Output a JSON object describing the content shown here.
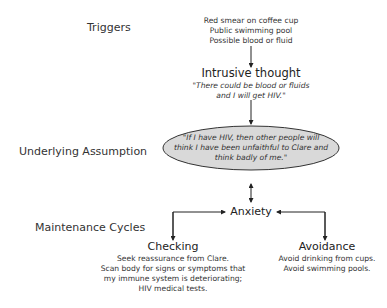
{
  "rows": {
    "triggers_label": "Triggers",
    "assumption_label": "Underlying Assumption",
    "maintenance_label": "Maintenance Cycles"
  },
  "triggers": {
    "items": [
      "Red smear on coffee cup",
      "Public swimming pool",
      "Possible blood or fluid"
    ]
  },
  "intrusive_thought": {
    "title": "Intrusive thought",
    "quote_lines": [
      "\"There could be blood or fluids",
      "and I will get HIV.\""
    ]
  },
  "assumption": {
    "lines": [
      "\"If I have HIV, then other people will",
      "think I have been unfaithful to Clare and",
      "think badly of me.\""
    ],
    "fill_color": "#d9d9d9"
  },
  "anxiety": {
    "label": "Anxiety"
  },
  "checking": {
    "title": "Checking",
    "lines": [
      "Seek reassurance from Clare.",
      "Scan body for signs or symptoms that",
      "my immune system is deteriorating;",
      "HIV medical tests."
    ]
  },
  "avoidance": {
    "title": "Avoidance",
    "lines": [
      "Avoid drinking from cups.",
      "Avoid swimming pools."
    ]
  }
}
